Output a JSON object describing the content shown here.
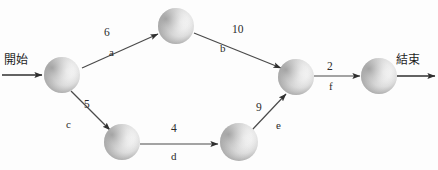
{
  "diagram": {
    "background_color": "#fdfdfd",
    "node_color_dark": "#8e8e8e",
    "node_color_light": "#ffffff",
    "edge_color": "#4a4a4a",
    "text_color": "#2b2b2b",
    "start_label": "開始",
    "end_label": "結束",
    "nodes": [
      {
        "id": "n1",
        "cx": 62,
        "cy": 75,
        "r": 18
      },
      {
        "id": "n2",
        "cx": 176,
        "cy": 26,
        "r": 18
      },
      {
        "id": "n3",
        "cx": 122,
        "cy": 142,
        "r": 18
      },
      {
        "id": "n4",
        "cx": 239,
        "cy": 142,
        "r": 19
      },
      {
        "id": "n5",
        "cx": 296,
        "cy": 77,
        "r": 18
      },
      {
        "id": "n6",
        "cx": 379,
        "cy": 76,
        "r": 18
      }
    ],
    "edges": [
      {
        "id": "a",
        "from": "n1",
        "to": "n2",
        "weight": "6",
        "name": "a",
        "x1": 82,
        "y1": 68,
        "x2": 158,
        "y2": 34,
        "weight_x": 104,
        "weight_y": 27,
        "name_x": 109,
        "name_y": 47
      },
      {
        "id": "b",
        "from": "n2",
        "to": "n5",
        "weight": "10",
        "name": "b",
        "x1": 194,
        "y1": 33,
        "x2": 281,
        "y2": 68,
        "weight_x": 232,
        "weight_y": 24,
        "name_x": 220,
        "name_y": 43
      },
      {
        "id": "c",
        "from": "n1",
        "to": "n3",
        "weight": "5",
        "name": "c",
        "x1": 71,
        "y1": 91,
        "x2": 110,
        "y2": 130,
        "weight_x": 84,
        "weight_y": 99,
        "name_x": 66,
        "name_y": 119
      },
      {
        "id": "d",
        "from": "n3",
        "to": "n4",
        "weight": "4",
        "name": "d",
        "x1": 140,
        "y1": 144,
        "x2": 218,
        "y2": 144,
        "weight_x": 171,
        "weight_y": 123,
        "name_x": 171,
        "name_y": 151
      },
      {
        "id": "e",
        "from": "n4",
        "to": "n5",
        "weight": "9",
        "name": "e",
        "x1": 252,
        "y1": 130,
        "x2": 286,
        "y2": 94,
        "weight_x": 256,
        "weight_y": 102,
        "name_x": 276,
        "name_y": 120
      },
      {
        "id": "f",
        "from": "n5",
        "to": "n6",
        "weight": "2",
        "name": "f",
        "x1": 314,
        "y1": 76,
        "x2": 360,
        "y2": 76,
        "weight_x": 327,
        "weight_y": 61,
        "name_x": 329,
        "name_y": 81
      }
    ],
    "terminals": {
      "start": {
        "label_x": 4,
        "label_y": 54,
        "line_x1": 2,
        "line_y1": 75,
        "line_x2": 42,
        "line_y2": 75
      },
      "end": {
        "label_x": 396,
        "label_y": 54,
        "line_x1": 397,
        "line_y1": 76,
        "line_x2": 435,
        "line_y2": 76
      }
    }
  }
}
